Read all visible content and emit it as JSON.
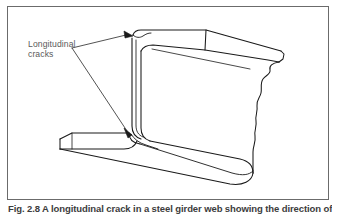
{
  "figure": {
    "frame_color": "#6b6b6b",
    "background_color": "#ffffff",
    "line_color": "#1a1a1a",
    "label_color": "#5a5a5a"
  },
  "annotation": {
    "label_line_1": "Longitudinal",
    "label_line_2": "cracks",
    "leader_origin": {
      "x": 72,
      "y": 48
    },
    "arrow_targets": [
      {
        "x": 131,
        "y": 37,
        "name": "upper-crack"
      },
      {
        "x": 131,
        "y": 133,
        "name": "lower-crack"
      }
    ]
  },
  "caption": {
    "text": "Fig. 2.8  A longitudinal crack in a steel girder web showing the direction of"
  },
  "drawing": {
    "name": "beam-section-perspective",
    "description": "Line drawing of a structural channel beam section in perspective with a wavy break line at the right end",
    "parts": [
      "top-flange",
      "web",
      "bottom-flange",
      "break-line",
      "longitudinal-crack-upper",
      "longitudinal-crack-lower"
    ]
  }
}
